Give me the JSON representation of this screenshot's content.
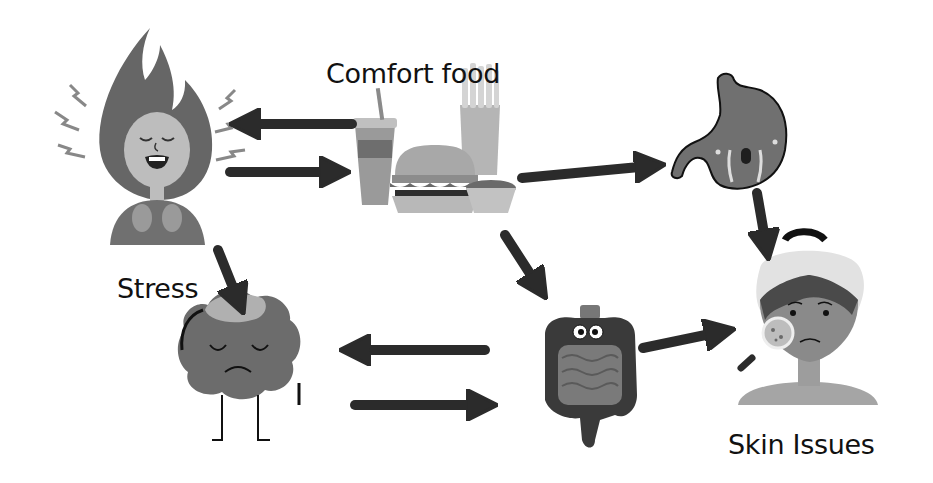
{
  "diagram": {
    "colors": {
      "background": "#ffffff",
      "arrow": "#2b2b2b",
      "text": "#111111",
      "figure_dark": "#555555",
      "figure_mid": "#8a8a8a",
      "figure_light": "#c8c8c8"
    },
    "nodes": [
      {
        "id": "stress",
        "label": "Stress",
        "icon": "stressed-person-icon"
      },
      {
        "id": "comfort_food",
        "label": "Comfort food",
        "icon": "fast-food-icon"
      },
      {
        "id": "stomach",
        "label": "",
        "icon": "crying-stomach-icon"
      },
      {
        "id": "brain",
        "label": "",
        "icon": "sad-brain-icon"
      },
      {
        "id": "gut",
        "label": "",
        "icon": "intestines-icon"
      },
      {
        "id": "skin",
        "label": "Skin Issues",
        "icon": "woman-with-acne-icon"
      }
    ],
    "edges": [
      {
        "from": "comfort_food",
        "to": "stress"
      },
      {
        "from": "stress",
        "to": "comfort_food"
      },
      {
        "from": "comfort_food",
        "to": "stomach"
      },
      {
        "from": "comfort_food",
        "to": "gut"
      },
      {
        "from": "stress",
        "to": "brain"
      },
      {
        "from": "stomach",
        "to": "skin"
      },
      {
        "from": "gut",
        "to": "brain"
      },
      {
        "from": "brain",
        "to": "gut"
      },
      {
        "from": "gut",
        "to": "skin"
      }
    ],
    "labels": {
      "stress": "Stress",
      "comfort_food": "Comfort food",
      "skin": "Skin Issues"
    }
  }
}
